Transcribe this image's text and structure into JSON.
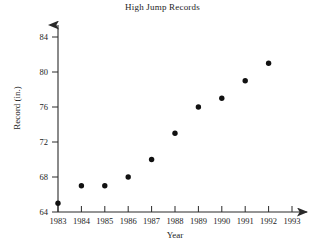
{
  "chart_data": {
    "type": "scatter",
    "title": "High Jump Records",
    "xlabel": "Year",
    "ylabel": "Record (in.)",
    "x": [
      1983,
      1984,
      1985,
      1986,
      1987,
      1988,
      1989,
      1990,
      1991,
      1992
    ],
    "values": [
      65,
      67,
      67,
      68,
      70,
      73,
      76,
      77,
      79,
      81
    ],
    "points": [
      {
        "x": 1983,
        "y": 65
      },
      {
        "x": 1984,
        "y": 67
      },
      {
        "x": 1985,
        "y": 67
      },
      {
        "x": 1986,
        "y": 68
      },
      {
        "x": 1987,
        "y": 70
      },
      {
        "x": 1988,
        "y": 73
      },
      {
        "x": 1989,
        "y": 76
      },
      {
        "x": 1990,
        "y": 77
      },
      {
        "x": 1991,
        "y": 79
      },
      {
        "x": 1992,
        "y": 81
      }
    ],
    "xticks": [
      1983,
      1984,
      1985,
      1986,
      1987,
      1988,
      1989,
      1990,
      1991,
      1992,
      1993
    ],
    "xtick_labels": [
      "1983",
      "1984",
      "1985",
      "1986",
      "1987",
      "1988",
      "1989",
      "1990",
      "1991",
      "1992",
      "1993"
    ],
    "yticks": [
      64,
      68,
      72,
      76,
      80,
      84
    ],
    "ytick_labels": [
      "64",
      "68",
      "72",
      "76",
      "80",
      "84"
    ],
    "xlim": [
      1983,
      1993
    ],
    "ylim": [
      64,
      85
    ],
    "grid": false,
    "legend": false,
    "marker_color": "#111111",
    "axis_color": "#2a2a2a",
    "background_color": "#ffffff"
  }
}
